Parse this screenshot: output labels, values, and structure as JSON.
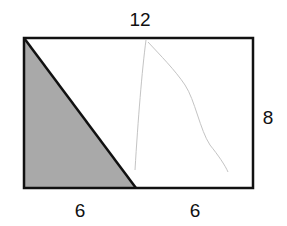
{
  "diagram": {
    "type": "geometry",
    "shape": "rectangle divided by diagonal into shaded right triangle",
    "labels": {
      "top": "12",
      "right": "8",
      "bottom_left": "6",
      "bottom_right": "6"
    },
    "colors": {
      "outline": "#111111",
      "shaded": "#a9a9a9",
      "pencil_mark": "#bdbdbd"
    }
  }
}
